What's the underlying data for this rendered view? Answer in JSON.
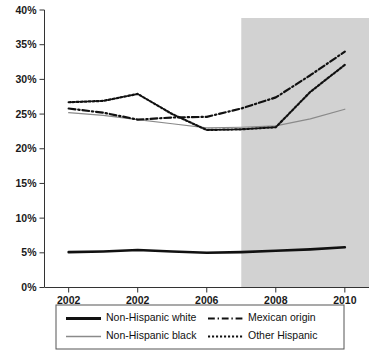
{
  "chart_data": {
    "type": "line",
    "title": "",
    "subtitle": "",
    "xlabel": "",
    "ylabel": "",
    "xlim": [
      2001.3,
      2010.7
    ],
    "ylim": [
      0,
      40
    ],
    "grid": false,
    "legend_position": "bottom",
    "y_ticks": [
      0,
      5,
      10,
      15,
      20,
      25,
      30,
      35,
      40
    ],
    "y_tick_labels": [
      "0%",
      "5%",
      "10%",
      "15%",
      "20%",
      "25%",
      "30%",
      "35%",
      "40%"
    ],
    "x_ticks": [
      2002,
      2004,
      2006,
      2008,
      2010
    ],
    "x_tick_labels": [
      "2002",
      "2002",
      "2006",
      "2008",
      "2010"
    ],
    "x": [
      2002,
      2003,
      2004,
      2005,
      2006,
      2007,
      2008,
      2009,
      2010
    ],
    "shaded_region": {
      "label": "",
      "x_start": 2007,
      "x_end": 2010.7,
      "color": "#d2d2d2"
    },
    "series": [
      {
        "name": "Non-Hispanic white",
        "values": [
          5.1,
          5.2,
          5.4,
          5.2,
          5.0,
          5.1,
          5.3,
          5.5,
          5.8
        ],
        "style": "solid",
        "color": "#111111",
        "width": 2.6
      },
      {
        "name": "Non-Hispanic black",
        "values": [
          25.2,
          24.8,
          24.2,
          23.6,
          23.0,
          23.1,
          23.3,
          24.3,
          25.7
        ],
        "style": "solid",
        "color": "#8a8a8a",
        "width": 1.2
      },
      {
        "name": "Mexican origin",
        "values": [
          25.8,
          25.2,
          24.2,
          24.5,
          24.6,
          25.8,
          27.4,
          30.6,
          34.0
        ],
        "style": "dashdot",
        "color": "#111111",
        "width": 2.2
      },
      {
        "name": "Other Hispanic",
        "values": [
          26.7,
          26.9,
          27.9,
          25.0,
          22.7,
          22.8,
          23.1,
          28.2,
          32.1
        ],
        "style": "dotted",
        "color": "#111111",
        "width": 2.2
      }
    ],
    "legend_entries": [
      {
        "name": "Non-Hispanic white",
        "style": "solid",
        "color": "#111111",
        "width": 2.8
      },
      {
        "name": "Mexican origin",
        "style": "dashdot",
        "color": "#111111",
        "width": 2.2
      },
      {
        "name": "Non-Hispanic black",
        "style": "solid",
        "color": "#8a8a8a",
        "width": 1.4
      },
      {
        "name": "Other Hispanic",
        "style": "dotted",
        "color": "#111111",
        "width": 2.2
      }
    ],
    "axis_color": "#333333"
  }
}
